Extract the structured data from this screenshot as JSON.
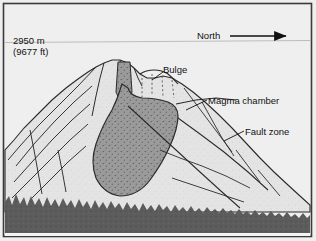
{
  "diagram": {
    "type": "geologic-cross-section",
    "background_color": "#eeeeee",
    "frame_color": "#3a3a3a"
  },
  "labels": {
    "elevation_m": "2950 m",
    "elevation_ft": "(9677 ft)",
    "north": "North",
    "bulge": "Bulge",
    "magma_chamber": "Magma chamber",
    "fault_zone": "Fault zone"
  },
  "features": {
    "mountain": {
      "fill": "#e4e4e4",
      "outline": "#2b2b2b"
    },
    "magma_chamber": {
      "fill": "#9b9b9b",
      "outline": "#2b2b2b",
      "stipple": true
    },
    "forest": {
      "fill": "#5c5c5c"
    },
    "elevation_line": {
      "color": "#b9b9b9"
    },
    "north_arrow": {
      "color": "#111111"
    }
  }
}
